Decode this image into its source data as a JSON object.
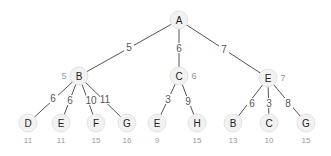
{
  "diagram": {
    "type": "weighted-search-tree",
    "nodes": [
      {
        "id": "n_A",
        "label": "A",
        "x": 179,
        "y": 20
      },
      {
        "id": "n_B",
        "label": "B",
        "x": 79,
        "y": 76,
        "cost": "5",
        "cost_pos": "left"
      },
      {
        "id": "n_C",
        "label": "C",
        "x": 179,
        "y": 76,
        "cost": "6",
        "cost_pos": "right"
      },
      {
        "id": "n_E1",
        "label": "E",
        "x": 268,
        "y": 78,
        "cost": "7",
        "cost_pos": "right"
      },
      {
        "id": "n_D",
        "label": "D",
        "x": 28,
        "y": 123,
        "cost": "11",
        "cost_pos": "below"
      },
      {
        "id": "n_E2",
        "label": "E",
        "x": 61,
        "y": 123,
        "cost": "11",
        "cost_pos": "below"
      },
      {
        "id": "n_F",
        "label": "F",
        "x": 96,
        "y": 123,
        "cost": "15",
        "cost_pos": "below"
      },
      {
        "id": "n_G1",
        "label": "G",
        "x": 127,
        "y": 123,
        "cost": "16",
        "cost_pos": "below"
      },
      {
        "id": "n_E3",
        "label": "E",
        "x": 157,
        "y": 123,
        "cost": "9",
        "cost_pos": "below"
      },
      {
        "id": "n_H",
        "label": "H",
        "x": 197,
        "y": 123,
        "cost": "15",
        "cost_pos": "below"
      },
      {
        "id": "n_B2",
        "label": "B",
        "x": 233,
        "y": 123,
        "cost": "13",
        "cost_pos": "below"
      },
      {
        "id": "n_C2",
        "label": "C",
        "x": 269,
        "y": 123,
        "cost": "10",
        "cost_pos": "below"
      },
      {
        "id": "n_G2",
        "label": "G",
        "x": 306,
        "y": 123,
        "cost": "15",
        "cost_pos": "below"
      }
    ],
    "edges": [
      {
        "from": "n_A",
        "to": "n_B",
        "weight": "5",
        "lx": 129,
        "ly": 47
      },
      {
        "from": "n_A",
        "to": "n_C",
        "weight": "6",
        "lx": 179,
        "ly": 48
      },
      {
        "from": "n_A",
        "to": "n_E1",
        "weight": "7",
        "lx": 224,
        "ly": 49
      },
      {
        "from": "n_B",
        "to": "n_D",
        "weight": "6",
        "lx": 53,
        "ly": 98
      },
      {
        "from": "n_B",
        "to": "n_E2",
        "weight": "6",
        "lx": 70,
        "ly": 100
      },
      {
        "from": "n_B",
        "to": "n_F",
        "weight": "10",
        "lx": 91,
        "ly": 100
      },
      {
        "from": "n_B",
        "to": "n_G1",
        "weight": "11",
        "lx": 105,
        "ly": 99
      },
      {
        "from": "n_C",
        "to": "n_E3",
        "weight": "3",
        "lx": 168,
        "ly": 99
      },
      {
        "from": "n_C",
        "to": "n_H",
        "weight": "9",
        "lx": 188,
        "ly": 101
      },
      {
        "from": "n_E1",
        "to": "n_B2",
        "weight": "6",
        "lx": 252,
        "ly": 103
      },
      {
        "from": "n_E1",
        "to": "n_C2",
        "weight": "3",
        "lx": 269,
        "ly": 103
      },
      {
        "from": "n_E1",
        "to": "n_G2",
        "weight": "8",
        "lx": 288,
        "ly": 103
      }
    ]
  }
}
